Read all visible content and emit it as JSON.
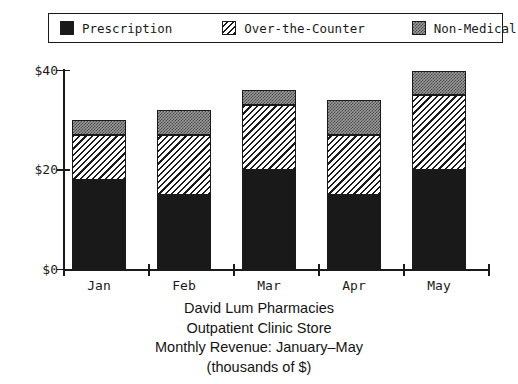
{
  "legend": {
    "items": [
      {
        "label": "Prescription",
        "swatch": "solid-black-swatch-icon",
        "fill": "solid",
        "color": "#191919"
      },
      {
        "label": "Over-the-Counter",
        "swatch": "diagonal-hatch-swatch-icon",
        "fill": "hatch",
        "color": "#1a1a1a"
      },
      {
        "label": "Non-Medical",
        "swatch": "stipple-grey-swatch-icon",
        "fill": "stipple",
        "color": "#9a9a9a"
      }
    ]
  },
  "axes": {
    "y_ticks": [
      "$0",
      "$20",
      "$40"
    ],
    "x_ticks": [
      "Jan",
      "Feb",
      "Mar",
      "Apr",
      "May"
    ]
  },
  "caption": {
    "line1": "David Lum Pharmacies",
    "line2": "Outpatient Clinic Store",
    "line3": "Monthly Revenue: January–May",
    "line4": "(thousands of $)"
  },
  "chart_data": {
    "type": "bar",
    "stacked": true,
    "title": "David Lum Pharmacies Outpatient Clinic Store Monthly Revenue: January–May (thousands of $)",
    "xlabel": "",
    "ylabel": "",
    "categories": [
      "Jan",
      "Feb",
      "Mar",
      "Apr",
      "May"
    ],
    "series": [
      {
        "name": "Prescription",
        "values": [
          18,
          15,
          20,
          15,
          20
        ]
      },
      {
        "name": "Over-the-Counter",
        "values": [
          9,
          12,
          13,
          12,
          15
        ]
      },
      {
        "name": "Non-Medical",
        "values": [
          3,
          5,
          3,
          7,
          5
        ]
      }
    ],
    "totals": [
      30,
      32,
      36,
      34,
      40
    ],
    "ylim": [
      0,
      40
    ],
    "ytick_values": [
      0,
      20,
      40
    ],
    "ytick_labels": [
      "$0",
      "$20",
      "$40"
    ],
    "units": "thousands of $",
    "grid": false,
    "legend_position": "top"
  }
}
